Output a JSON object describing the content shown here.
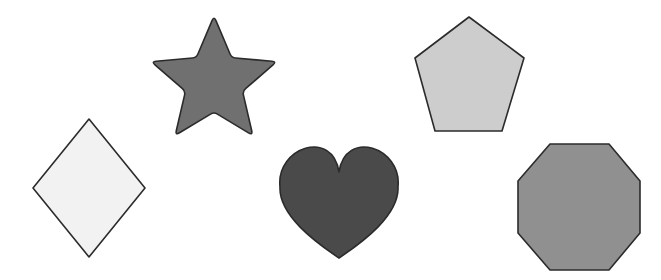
{
  "canvas": {
    "width": 661,
    "height": 280,
    "background": "#ffffff",
    "title": "Geometric Shapes Collection"
  },
  "style": {
    "stroke_color": "#2b2b2b",
    "stroke_width": 1.6
  },
  "shapes": [
    {
      "id": "diamond",
      "name": "diamond",
      "label": "Diamond",
      "sides": 4,
      "fill": "#f2f2f2",
      "stroke": "#2b2b2b",
      "center": {
        "x": 89,
        "y": 188
      },
      "bbox": {
        "x": 33,
        "y": 119,
        "width": 112,
        "height": 138
      },
      "points": "89,119 145,188 89,257 33,188"
    },
    {
      "id": "star",
      "name": "star",
      "label": "Star",
      "sides": 5,
      "fill": "#707070",
      "stroke": "#2b2b2b",
      "center": {
        "x": 214,
        "y": 82
      },
      "bbox": {
        "x": 150,
        "y": 17,
        "width": 128,
        "height": 125
      },
      "outer_radius": 66,
      "inner_radius": 30,
      "corner_radius": 5
    },
    {
      "id": "heart",
      "name": "heart",
      "label": "Heart",
      "sides": 0,
      "fill": "#4a4a4a",
      "stroke": "#2b2b2b",
      "center": {
        "x": 339,
        "y": 200
      },
      "bbox": {
        "x": 280,
        "y": 145,
        "width": 118,
        "height": 113
      },
      "cleft": {
        "x": 339,
        "y": 172
      },
      "tip": {
        "x": 339,
        "y": 258
      }
    },
    {
      "id": "pentagon",
      "name": "pentagon",
      "label": "Pentagon",
      "sides": 5,
      "fill": "#cdcdcd",
      "stroke": "#2b2b2b",
      "center": {
        "x": 469,
        "y": 78
      },
      "bbox": {
        "x": 415,
        "y": 17,
        "width": 109,
        "height": 114
      },
      "points": "469,17 524,58 502,131 435,131 415,58"
    },
    {
      "id": "octagon",
      "name": "octagon",
      "label": "Octagon",
      "sides": 8,
      "fill": "#909090",
      "stroke": "#2b2b2b",
      "center": {
        "x": 579,
        "y": 207
      },
      "bbox": {
        "x": 518,
        "y": 144,
        "width": 122,
        "height": 126
      },
      "points": "550,144 609,144 640,181 640,233 609,270 550,270 518,233 518,181"
    }
  ]
}
